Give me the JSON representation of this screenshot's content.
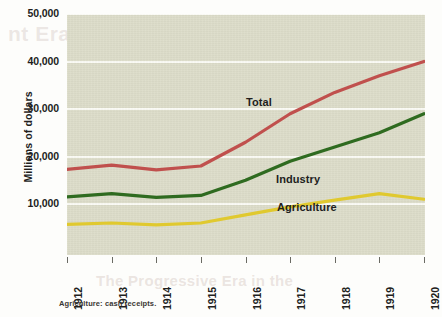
{
  "background_text": {
    "top_bleed": "nt Era: Creating a New",
    "mid_bleed": "e 21.1 Rising U.S. national income",
    "bottom_bleed": "The Progressive Era in the"
  },
  "footnote": "Agriculture: cash receipts.",
  "colors": {
    "plot_background": "#dcdcc8",
    "gridline": "#fbfbf5",
    "total": "#c0504d",
    "industry": "#2f6b20",
    "agriculture": "#e0c92f",
    "text": "#221e1d"
  },
  "chart_data": {
    "type": "line",
    "title": "",
    "xlabel": "",
    "ylabel": "Millions of dollars",
    "grid": true,
    "legend": "inline-labels",
    "x": [
      "1912",
      "1913",
      "1914",
      "1915",
      "1916",
      "1917",
      "1918",
      "1919",
      "1920"
    ],
    "xtick_labels": [
      "1912",
      "1913",
      "1914",
      "1915",
      "1916",
      "1917",
      "1918",
      "1919",
      "1920"
    ],
    "ylim": [
      0,
      50000
    ],
    "ytick_labels": [
      "50,000",
      "40,000",
      "30,000",
      "20,000",
      "10,000"
    ],
    "ytick_values": [
      50000,
      40000,
      30000,
      20000,
      10000
    ],
    "series": [
      {
        "name": "Total",
        "color": "#c0504d",
        "label": "Total",
        "values": [
          17300,
          18200,
          17200,
          18000,
          23000,
          29000,
          33500,
          37000,
          40000
        ]
      },
      {
        "name": "Industry",
        "color": "#2f6b20",
        "label": "Industry",
        "values": [
          11500,
          12200,
          11400,
          11800,
          15000,
          19000,
          22000,
          25000,
          29000
        ]
      },
      {
        "name": "Agriculture",
        "color": "#e0c92f",
        "label": "Agriculture",
        "values": [
          5700,
          6000,
          5600,
          6000,
          7700,
          9400,
          10800,
          12200,
          11000
        ]
      }
    ]
  }
}
